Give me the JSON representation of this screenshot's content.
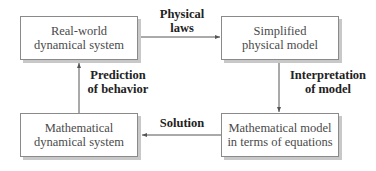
{
  "diagram": {
    "type": "cycle-flowchart",
    "nodes": [
      {
        "id": "real_world",
        "lines": [
          "Real-world",
          "dynamical system"
        ],
        "position": "top-left"
      },
      {
        "id": "simplified",
        "lines": [
          "Simplified",
          "physical model"
        ],
        "position": "top-right"
      },
      {
        "id": "math_model",
        "lines": [
          "Mathematical model",
          "in terms of equations"
        ],
        "position": "bottom-right"
      },
      {
        "id": "math_dynamical",
        "lines": [
          "Mathematical",
          "dynamical system"
        ],
        "position": "bottom-left"
      }
    ],
    "edges": [
      {
        "from": "real_world",
        "to": "simplified",
        "lines": [
          "Physical",
          "laws"
        ]
      },
      {
        "from": "simplified",
        "to": "math_model",
        "lines": [
          "Interpretation",
          "of model"
        ]
      },
      {
        "from": "math_model",
        "to": "math_dynamical",
        "lines": [
          "Solution"
        ]
      },
      {
        "from": "math_dynamical",
        "to": "real_world",
        "lines": [
          "Prediction",
          "of behavior"
        ]
      }
    ],
    "colors": {
      "box_border": "#8a8a8a",
      "box_shadow": "#c8c8c8",
      "arrow": "#555555",
      "node_text": "#4a4a4a",
      "label_text": "#222222"
    }
  }
}
